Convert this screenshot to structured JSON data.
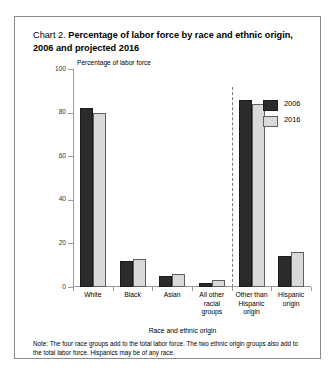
{
  "chart_data": {
    "type": "bar",
    "title_lead": "Chart 2.",
    "title": "Percentage of labor force by race and ethnic origin, 2006 and projected 2016",
    "ylabel": "Percentage of labor force",
    "xlabel": "Race and ethnic origin",
    "ylim": [
      0,
      100
    ],
    "yticks": [
      0,
      20,
      40,
      60,
      80,
      100
    ],
    "grid": false,
    "legend_position": "top-right",
    "categories": [
      "White",
      "Black",
      "Asian",
      "All other racial groups",
      "Other than Hispanic origin",
      "Hispanic origin"
    ],
    "series": [
      {
        "name": "2006",
        "color": "#2b2b2b",
        "values": [
          82,
          12,
          5,
          2,
          86,
          14
        ]
      },
      {
        "name": "2016",
        "color": "#d9d9d9",
        "values": [
          80,
          13,
          6,
          3,
          84,
          16
        ]
      }
    ],
    "annotations": [
      "Dashed vertical divider separates the four race groups from the two ethnic origin groups."
    ],
    "note": "Note:  The four race groups add to the total labor force. The two ethnic origin groups also add to the total labor force. Hispanics may be of any race."
  },
  "category_lines": [
    [
      "White"
    ],
    [
      "Black"
    ],
    [
      "Asian"
    ],
    [
      "All other",
      "racial",
      "groups"
    ],
    [
      "Other than",
      "Hispanic",
      "origin"
    ],
    [
      "Hispanic",
      "origin"
    ]
  ],
  "ytick_labels": [
    "0",
    "20",
    "40",
    "60",
    "80",
    "100"
  ]
}
